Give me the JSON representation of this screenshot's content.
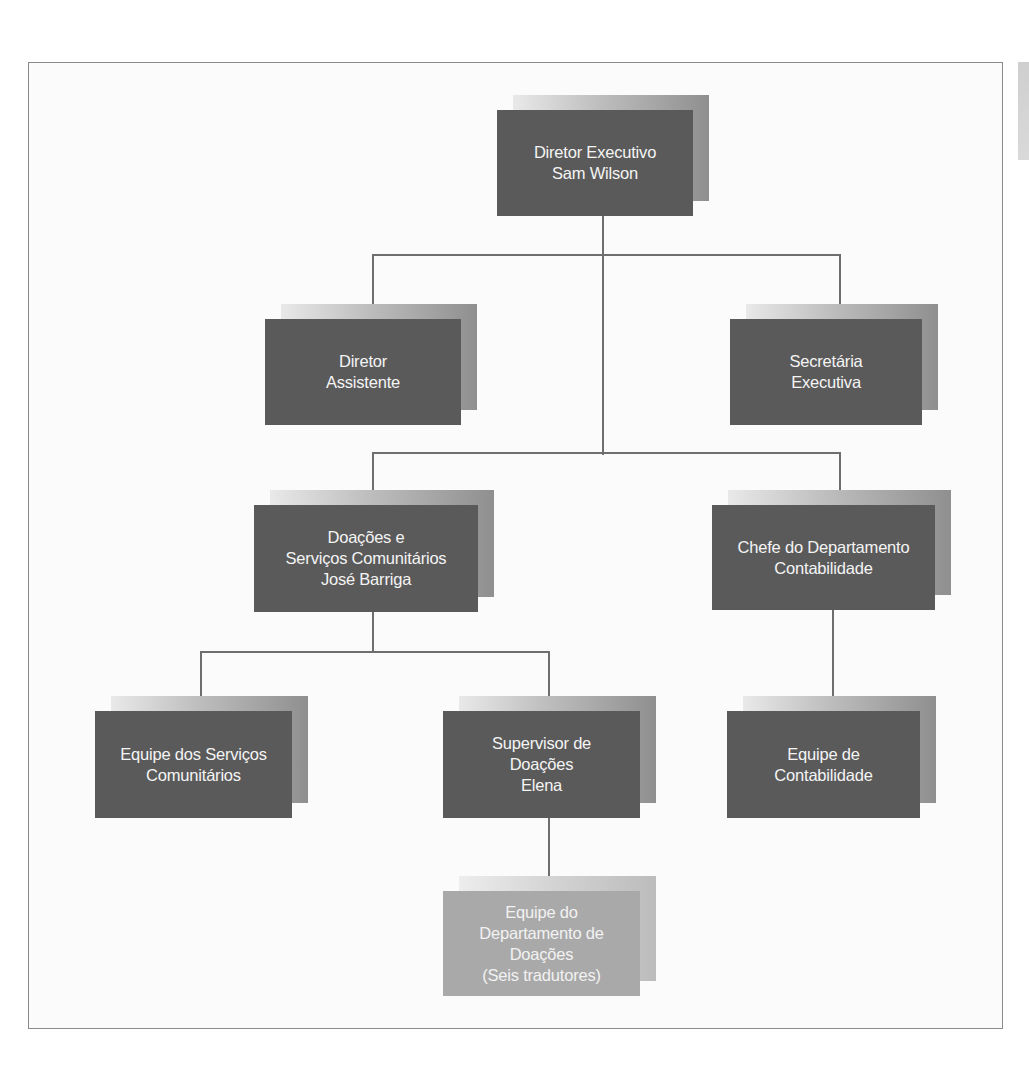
{
  "diagram": {
    "type": "org-chart",
    "colors": {
      "box_dark": "#5a5a5a",
      "box_light": "#a9a9a9",
      "box_text": "#f4f4f4",
      "connector": "#6e6e6e",
      "frame_border": "#8a8a8a"
    },
    "nodes": {
      "ceo": {
        "lines": [
          "Diretor Executivo",
          "Sam Wilson"
        ]
      },
      "assistant_director": {
        "lines": [
          "Diretor",
          "Assistente"
        ]
      },
      "executive_secretary": {
        "lines": [
          "Secretária",
          "Executiva"
        ]
      },
      "donations_community": {
        "lines": [
          "Doações e",
          "Serviços Comunitários",
          "José Barriga"
        ]
      },
      "accounting_head": {
        "lines": [
          "Chefe do Departamento",
          "Contabilidade"
        ]
      },
      "community_services_team": {
        "lines": [
          "Equipe dos Serviços",
          "Comunitários"
        ]
      },
      "donations_supervisor": {
        "lines": [
          "Supervisor de",
          "Doações",
          "Elena"
        ]
      },
      "accounting_team": {
        "lines": [
          "Equipe de",
          "Contabilidade"
        ]
      },
      "donations_dept_team": {
        "lines": [
          "Equipe do",
          "Departamento de",
          "Doações",
          "(Seis tradutores)"
        ]
      }
    },
    "edges": [
      [
        "ceo",
        "assistant_director"
      ],
      [
        "ceo",
        "executive_secretary"
      ],
      [
        "ceo",
        "donations_community"
      ],
      [
        "ceo",
        "accounting_head"
      ],
      [
        "donations_community",
        "community_services_team"
      ],
      [
        "donations_community",
        "donations_supervisor"
      ],
      [
        "accounting_head",
        "accounting_team"
      ],
      [
        "donations_supervisor",
        "donations_dept_team"
      ]
    ]
  }
}
